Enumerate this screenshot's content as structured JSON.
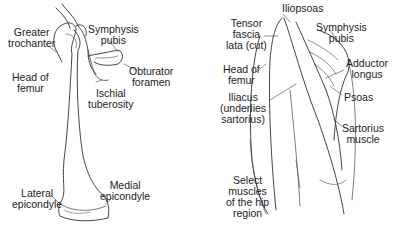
{
  "left_panel": {
    "title": "Femur and hip bone",
    "labels": {
      "greater_trochanter": [
        "Greater",
        "trochanter"
      ],
      "symphysis_pubis": [
        "Symphysis",
        "pubis"
      ],
      "head_of_femur": [
        "Head of",
        "femur"
      ],
      "obturator_foramen": [
        "Obturator",
        "foramen"
      ],
      "ischial_tuberosity": [
        "Ischial",
        "tuberosity"
      ],
      "lateral_epicondyle": [
        "Lateral",
        "epicondyle"
      ],
      "medial_epicondyle": [
        "Medial",
        "epicondyle"
      ]
    }
  },
  "right_panel": {
    "labels": {
      "iliopsoas": [
        "Iliopsoas"
      ],
      "tensor_fascia_lata": [
        "Tensor",
        "fascia",
        "lata (cut)"
      ],
      "symphysis_pubis": [
        "Symphysis",
        "pubis"
      ],
      "head_of_femur": [
        "Head of",
        "femur"
      ],
      "adductor_longus": [
        "Adductor",
        "longus"
      ],
      "iliacus": [
        "Iliacus",
        "(underlies",
        "sartorius)"
      ],
      "psoas": [
        "Psoas"
      ],
      "sartorius": [
        "Sartorius",
        "muscle"
      ],
      "caption": [
        "Select",
        "muscles",
        "of the hip",
        "region"
      ]
    }
  },
  "colors": {
    "line": "#444444",
    "text": "#222222",
    "background": "#ffffff"
  }
}
